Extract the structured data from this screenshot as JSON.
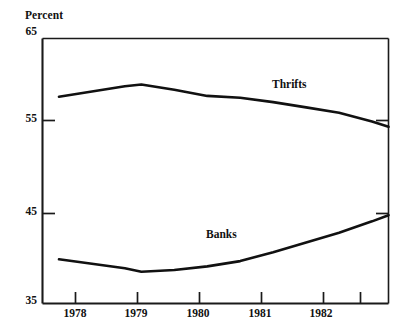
{
  "chart_data": {
    "type": "line",
    "title": "",
    "subtitle": "",
    "xlabel": "",
    "ylabel": "Percent",
    "ylim": [
      35,
      65
    ],
    "yticks": [
      35,
      45,
      55,
      65
    ],
    "ytick_labels": [
      "35",
      "45",
      "55",
      "65"
    ],
    "xlim": [
      1977.5,
      1982.75
    ],
    "xtick_labels": [
      "1978",
      "1979",
      "1980",
      "1981",
      "1982"
    ],
    "grid": false,
    "legend_position": "inline-annotations",
    "series": [
      {
        "name": "Thrifts",
        "color": "#111111",
        "x": [
          1977.75,
          1978.25,
          1978.75,
          1979.0,
          1979.5,
          1980.0,
          1980.5,
          1981.0,
          1981.5,
          1982.0,
          1982.5,
          1982.75
        ],
        "values": [
          58.4,
          59.0,
          59.6,
          59.8,
          59.2,
          58.5,
          58.3,
          57.8,
          57.2,
          56.6,
          55.6,
          55.0
        ]
      },
      {
        "name": "Banks",
        "color": "#111111",
        "x": [
          1977.75,
          1978.25,
          1978.75,
          1979.0,
          1979.5,
          1980.0,
          1980.5,
          1981.0,
          1981.5,
          1982.0,
          1982.5,
          1982.75
        ],
        "values": [
          40.0,
          39.5,
          39.0,
          38.6,
          38.8,
          39.2,
          39.8,
          40.8,
          41.9,
          43.0,
          44.3,
          45.0
        ]
      }
    ],
    "annotations": [
      {
        "text": "Thrifts",
        "x": 1981.1,
        "y": 58.6
      },
      {
        "text": "Banks",
        "x": 1980.0,
        "y": 42.0
      }
    ]
  },
  "axes": {
    "y_axis_title": "Percent",
    "y_ticks": [
      {
        "label": "65",
        "value": 65
      },
      {
        "label": "55",
        "value": 55
      },
      {
        "label": "45",
        "value": 45
      },
      {
        "label": "35",
        "value": 35
      }
    ],
    "x_ticks": [
      {
        "label": "1978"
      },
      {
        "label": "1979"
      },
      {
        "label": "1980"
      },
      {
        "label": "1981"
      },
      {
        "label": "1982"
      }
    ]
  },
  "series_labels": {
    "thrifts": "Thrifts",
    "banks": "Banks"
  },
  "style": {
    "line_color": "#111111",
    "axis_color": "#1a1a1a",
    "background": "#ffffff"
  }
}
